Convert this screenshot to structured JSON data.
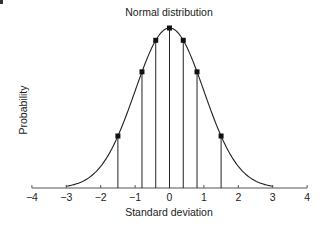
{
  "chart_data": {
    "type": "line",
    "title": "Normal distribution",
    "xlabel": "Standard deviation",
    "ylabel": "Probability",
    "xlim": [
      -4,
      4
    ],
    "x_ticks": [
      -4,
      -3,
      -2,
      -1,
      0,
      1,
      2,
      3,
      4
    ],
    "x_tick_labels": [
      "−4",
      "−3",
      "−2",
      "−1",
      "0",
      "1",
      "2",
      "3",
      "4"
    ],
    "curve": {
      "name": "Normal PDF",
      "mean": 0,
      "sd": 1,
      "x_range": [
        -3,
        3
      ]
    },
    "sample_points": {
      "x": [
        -1.5,
        -0.8,
        -0.4,
        0,
        0.4,
        0.8,
        1.5
      ],
      "y_relative": [
        0.325,
        0.726,
        0.923,
        1.0,
        0.923,
        0.726,
        0.325
      ]
    },
    "grid": false,
    "legend": null,
    "colors": {
      "line": "#222222",
      "marker": "#111111",
      "axis": "#555555"
    }
  },
  "labels": {
    "title": "Normal distribution",
    "xlabel": "Standard deviation",
    "ylabel": "Probability"
  }
}
